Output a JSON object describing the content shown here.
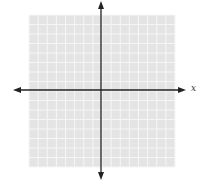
{
  "diagram": {
    "type": "coordinate-plane",
    "x_axis_label": "x",
    "grid": {
      "left": 29,
      "top": 15,
      "right": 175,
      "bottom": 167,
      "cells_x": 16,
      "cells_y": 16
    },
    "origin": {
      "x": 101,
      "y": 90
    },
    "colors": {
      "grid_fill": "#e4e4e4",
      "grid_line": "#f6f6f6",
      "axis": "#222222"
    }
  }
}
